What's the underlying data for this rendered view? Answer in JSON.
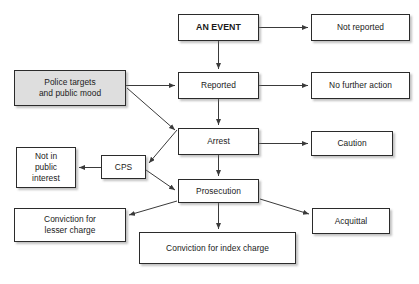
{
  "diagram": {
    "background_color": "#ffffff",
    "box_fill_white": "#ffffff",
    "box_fill_shaded": "#dedede",
    "border_color": "#2b2b2b",
    "arrow_color": "#3a3a3a",
    "text_color": "#1a1a1a",
    "nodes": [
      {
        "id": "an-event",
        "label": "AN EVENT",
        "emphasis": "bold",
        "fill": "white",
        "x": 178,
        "y": 14,
        "w": 81,
        "h": 27
      },
      {
        "id": "not-reported",
        "label": "Not reported",
        "emphasis": "normal",
        "fill": "white",
        "x": 311,
        "y": 14,
        "w": 99,
        "h": 27
      },
      {
        "id": "police-targets",
        "label": "Police targets\nand public mood",
        "emphasis": "normal",
        "fill": "shaded",
        "x": 14,
        "y": 70,
        "w": 112,
        "h": 36
      },
      {
        "id": "reported",
        "label": "Reported",
        "emphasis": "normal",
        "fill": "white",
        "x": 178,
        "y": 72,
        "w": 81,
        "h": 27
      },
      {
        "id": "no-further-action",
        "label": "No further action",
        "emphasis": "normal",
        "fill": "white",
        "x": 311,
        "y": 72,
        "w": 99,
        "h": 27
      },
      {
        "id": "arrest",
        "label": "Arrest",
        "emphasis": "normal",
        "fill": "white",
        "x": 178,
        "y": 128,
        "w": 81,
        "h": 27
      },
      {
        "id": "caution",
        "label": "Caution",
        "emphasis": "normal",
        "fill": "white",
        "x": 311,
        "y": 131,
        "w": 82,
        "h": 25
      },
      {
        "id": "not-in-public-interest",
        "label": "Not in\npublic\ninterest",
        "emphasis": "normal",
        "fill": "white",
        "x": 16,
        "y": 147,
        "w": 60,
        "h": 41
      },
      {
        "id": "cps",
        "label": "CPS",
        "emphasis": "normal",
        "fill": "white",
        "x": 101,
        "y": 155,
        "w": 45,
        "h": 24
      },
      {
        "id": "prosecution",
        "label": "Prosecution",
        "emphasis": "normal",
        "fill": "white",
        "x": 178,
        "y": 179,
        "w": 81,
        "h": 24
      },
      {
        "id": "conviction-lesser-charge",
        "label": "Conviction for\nlesser charge",
        "emphasis": "normal",
        "fill": "white",
        "x": 14,
        "y": 208,
        "w": 112,
        "h": 34
      },
      {
        "id": "acquittal",
        "label": "Acquittal",
        "emphasis": "normal",
        "fill": "white",
        "x": 312,
        "y": 208,
        "w": 78,
        "h": 26
      },
      {
        "id": "conviction-index-charge",
        "label": "Conviction for index charge",
        "emphasis": "normal",
        "fill": "white",
        "x": 139,
        "y": 232,
        "w": 157,
        "h": 32
      }
    ],
    "edges": [
      {
        "id": "event-to-not-reported",
        "from": "an-event",
        "to": "not-reported",
        "x1": 259,
        "y1": 27.5,
        "x2": 308,
        "y2": 27.5
      },
      {
        "id": "event-to-reported",
        "from": "an-event",
        "to": "reported",
        "x1": 218.5,
        "y1": 41,
        "x2": 218.5,
        "y2": 69
      },
      {
        "id": "police-to-reported",
        "from": "police-targets",
        "to": "reported",
        "x1": 126,
        "y1": 85.5,
        "x2": 175,
        "y2": 85.5
      },
      {
        "id": "police-to-arrest",
        "from": "police-targets",
        "to": "arrest",
        "x1": 127,
        "y1": 88,
        "x2": 175,
        "y2": 130
      },
      {
        "id": "reported-to-no-further-action",
        "from": "reported",
        "to": "no-further-action",
        "x1": 259,
        "y1": 85.5,
        "x2": 308,
        "y2": 85.5
      },
      {
        "id": "reported-to-arrest",
        "from": "reported",
        "to": "arrest",
        "x1": 218.5,
        "y1": 99,
        "x2": 218.5,
        "y2": 125
      },
      {
        "id": "arrest-to-caution",
        "from": "arrest",
        "to": "caution",
        "x1": 259,
        "y1": 143.5,
        "x2": 308,
        "y2": 143.5
      },
      {
        "id": "arrest-to-cps",
        "from": "arrest",
        "to": "cps",
        "x1": 177,
        "y1": 130,
        "x2": 149,
        "y2": 163
      },
      {
        "id": "cps-to-not-in-public-interest",
        "from": "cps",
        "to": "not-in-public-interest",
        "x1": 101,
        "y1": 167.5,
        "x2": 79,
        "y2": 167.5
      },
      {
        "id": "arrest-to-prosecution",
        "from": "arrest",
        "to": "prosecution",
        "x1": 218.5,
        "y1": 155,
        "x2": 218.5,
        "y2": 176
      },
      {
        "id": "cps-to-prosecution",
        "from": "cps",
        "to": "prosecution",
        "x1": 146,
        "y1": 170,
        "x2": 175,
        "y2": 190
      },
      {
        "id": "prosecution-to-conviction-lesser",
        "from": "prosecution",
        "to": "conviction-lesser-charge",
        "x1": 177,
        "y1": 201,
        "x2": 129,
        "y2": 215
      },
      {
        "id": "prosecution-to-acquittal",
        "from": "prosecution",
        "to": "acquittal",
        "x1": 260,
        "y1": 199,
        "x2": 309,
        "y2": 214
      },
      {
        "id": "prosecution-to-conviction-index",
        "from": "prosecution",
        "to": "conviction-index-charge",
        "x1": 218.5,
        "y1": 203,
        "x2": 218.5,
        "y2": 229
      }
    ]
  }
}
